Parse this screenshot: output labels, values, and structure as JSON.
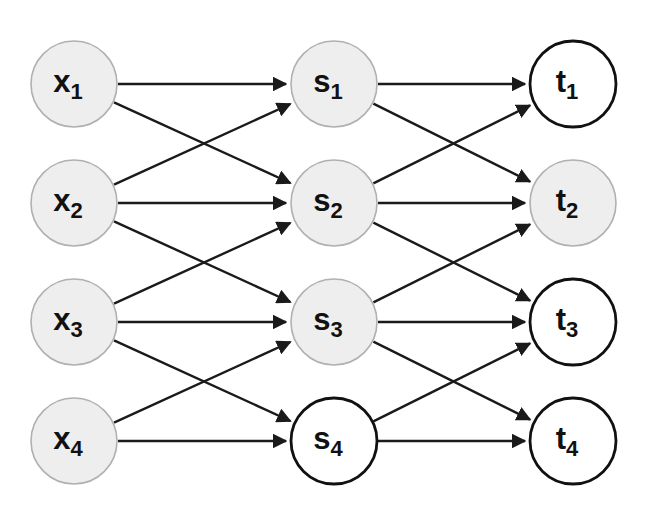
{
  "diagram": {
    "type": "layered-directed-graph",
    "background_color": "#ffffff",
    "canvas": {
      "width": 648,
      "height": 515
    },
    "style": {
      "node_radius": 43,
      "filled_fill_color": "#eeeeee",
      "filled_stroke_color": "#b0b0b0",
      "filled_stroke_width": 1.6,
      "empty_fill_color": "#ffffff",
      "empty_stroke_color": "#111111",
      "empty_stroke_width": 2.8,
      "edge_color": "#1a1a1a",
      "edge_width": 2.4,
      "label_color": "#111111"
    },
    "layers": [
      {
        "name": "input-layer",
        "key": "x",
        "cx": 74,
        "nodes": [
          {
            "id": "x1",
            "base": "x",
            "sub": "1",
            "label": "x₁",
            "cy": 84,
            "filled": true
          },
          {
            "id": "x2",
            "base": "x",
            "sub": "2",
            "label": "x₂",
            "cy": 203,
            "filled": true
          },
          {
            "id": "x3",
            "base": "x",
            "sub": "3",
            "label": "x₃",
            "cy": 322,
            "filled": true
          },
          {
            "id": "x4",
            "base": "x",
            "sub": "4",
            "label": "x₄",
            "cy": 441,
            "filled": true
          }
        ]
      },
      {
        "name": "hidden-layer",
        "key": "s",
        "cx": 334,
        "nodes": [
          {
            "id": "s1",
            "base": "s",
            "sub": "1",
            "label": "s₁",
            "cy": 84,
            "filled": true
          },
          {
            "id": "s2",
            "base": "s",
            "sub": "2",
            "label": "s₂",
            "cy": 203,
            "filled": true
          },
          {
            "id": "s3",
            "base": "s",
            "sub": "3",
            "label": "s₃",
            "cy": 322,
            "filled": true
          },
          {
            "id": "s4",
            "base": "s",
            "sub": "4",
            "label": "s₄",
            "cy": 441,
            "filled": false
          }
        ]
      },
      {
        "name": "output-layer",
        "key": "t",
        "cx": 573,
        "nodes": [
          {
            "id": "t1",
            "base": "t",
            "sub": "1",
            "label": "t₁",
            "cy": 84,
            "filled": false
          },
          {
            "id": "t2",
            "base": "t",
            "sub": "2",
            "label": "t₂",
            "cy": 203,
            "filled": true
          },
          {
            "id": "t3",
            "base": "t",
            "sub": "3",
            "label": "t₃",
            "cy": 322,
            "filled": false
          },
          {
            "id": "t4",
            "base": "t",
            "sub": "4",
            "label": "t₄",
            "cy": 441,
            "filled": false
          }
        ]
      }
    ],
    "edges": [
      {
        "from": "x1",
        "to": "s1"
      },
      {
        "from": "x1",
        "to": "s2"
      },
      {
        "from": "x2",
        "to": "s1"
      },
      {
        "from": "x2",
        "to": "s2"
      },
      {
        "from": "x2",
        "to": "s3"
      },
      {
        "from": "x3",
        "to": "s2"
      },
      {
        "from": "x3",
        "to": "s3"
      },
      {
        "from": "x3",
        "to": "s4"
      },
      {
        "from": "x4",
        "to": "s3"
      },
      {
        "from": "x4",
        "to": "s4"
      },
      {
        "from": "s1",
        "to": "t1"
      },
      {
        "from": "s1",
        "to": "t2"
      },
      {
        "from": "s2",
        "to": "t1"
      },
      {
        "from": "s2",
        "to": "t2"
      },
      {
        "from": "s2",
        "to": "t3"
      },
      {
        "from": "s3",
        "to": "t2"
      },
      {
        "from": "s3",
        "to": "t3"
      },
      {
        "from": "s3",
        "to": "t4"
      },
      {
        "from": "s4",
        "to": "t3"
      },
      {
        "from": "s4",
        "to": "t4"
      }
    ]
  }
}
